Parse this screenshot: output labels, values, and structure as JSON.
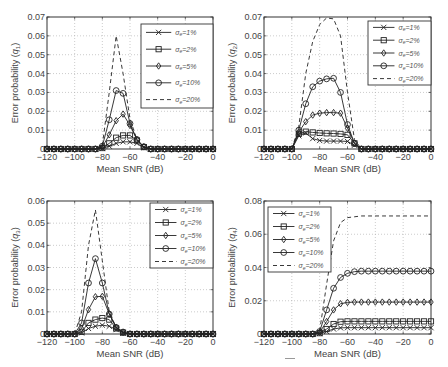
{
  "figure": {
    "x_ticks": [
      -120,
      -100,
      -80,
      -60,
      -40,
      -20,
      0
    ],
    "x_tick_labels": [
      "−120",
      "−100",
      "−80",
      "−60",
      "−40",
      "−20",
      "0"
    ],
    "xlabel": "Mean SNR (dB)",
    "legend_labels": [
      "σe=1%",
      "σe=2%",
      "σe=5%",
      "σe=10%",
      "σe=20%"
    ],
    "legend_prefix": "σ",
    "legend_sub": "e",
    "legend_values": [
      "=1%",
      "=2%",
      "=5%",
      "=10%",
      "=20%"
    ]
  },
  "chart_data": [
    {
      "type": "line",
      "id": "q1",
      "title": "",
      "xlabel": "Mean SNR (dB)",
      "ylabel": "Error probability (q1)",
      "ylabel_main": "Error probability (",
      "ylabel_sym": "q",
      "ylabel_sub": "1",
      "xlim": [
        -120,
        0
      ],
      "ylim": [
        0,
        0.07
      ],
      "y_ticks": [
        0,
        0.01,
        0.02,
        0.03,
        0.04,
        0.05,
        0.06,
        0.07
      ],
      "y_tick_labels": [
        "0",
        "0.01",
        "0.02",
        "0.03",
        "0.04",
        "0.05",
        "0.06",
        "0.07"
      ],
      "grid": true,
      "legend_position": "upper right",
      "x": [
        -120,
        -115,
        -110,
        -105,
        -100,
        -95,
        -90,
        -85,
        -80,
        -75,
        -70,
        -65,
        -60,
        -55,
        -50,
        -45,
        -40,
        -35,
        -30,
        -25,
        -20,
        -15,
        -10,
        -5,
        0
      ],
      "series": [
        {
          "name": "σe=1%",
          "marker": "x",
          "values": [
            0,
            0,
            0,
            0,
            0,
            0,
            0,
            0,
            0.0003,
            0.0015,
            0.003,
            0.0038,
            0.0038,
            0.003,
            0.0008,
            0,
            0,
            0,
            0,
            0,
            0,
            0,
            0,
            0,
            0
          ]
        },
        {
          "name": "σe=2%",
          "marker": "square",
          "values": [
            0,
            0,
            0,
            0,
            0,
            0,
            0,
            0,
            0.0005,
            0.003,
            0.006,
            0.0072,
            0.0072,
            0.0045,
            0.001,
            0,
            0,
            0,
            0,
            0,
            0,
            0,
            0,
            0,
            0
          ]
        },
        {
          "name": "σe=5%",
          "marker": "diamond",
          "values": [
            0,
            0,
            0,
            0,
            0,
            0,
            0,
            0,
            0.001,
            0.0075,
            0.015,
            0.0185,
            0.0125,
            0.005,
            0.0012,
            0,
            0,
            0,
            0,
            0,
            0,
            0,
            0,
            0,
            0
          ]
        },
        {
          "name": "σe=10%",
          "marker": "circle",
          "values": [
            0,
            0,
            0,
            0,
            0,
            0,
            0,
            0,
            0.0015,
            0.0155,
            0.031,
            0.0295,
            0.0135,
            0.005,
            0.0012,
            0,
            0,
            0,
            0,
            0,
            0,
            0,
            0,
            0,
            0
          ]
        },
        {
          "name": "σe=20%",
          "marker": "none",
          "dashed": true,
          "values": [
            0,
            0,
            0,
            0,
            0,
            0,
            0,
            0,
            0.002,
            0.03,
            0.06,
            0.04,
            0.016,
            0.005,
            0.001,
            0,
            0,
            0,
            0,
            0,
            0,
            0,
            0,
            0,
            0
          ]
        }
      ]
    },
    {
      "type": "line",
      "id": "q2",
      "title": "",
      "xlabel": "Mean SNR (dB)",
      "ylabel": "Error probability (q2)",
      "ylabel_main": "Error probability (",
      "ylabel_sym": "q",
      "ylabel_sub": "2",
      "xlim": [
        -120,
        0
      ],
      "ylim": [
        0,
        0.07
      ],
      "y_ticks": [
        0,
        0.01,
        0.02,
        0.03,
        0.04,
        0.05,
        0.06,
        0.07
      ],
      "y_tick_labels": [
        "0",
        "0.01",
        "0.02",
        "0.03",
        "0.04",
        "0.05",
        "0.06",
        "0.07"
      ],
      "grid": true,
      "legend_position": "upper right",
      "x": [
        -120,
        -115,
        -110,
        -105,
        -100,
        -95,
        -90,
        -85,
        -80,
        -75,
        -70,
        -65,
        -60,
        -55,
        -50,
        -45,
        -40,
        -35,
        -30,
        -25,
        -20,
        -15,
        -10,
        -5,
        0
      ],
      "series": [
        {
          "name": "σe=1%",
          "marker": "x",
          "values": [
            0,
            0,
            0,
            0,
            0,
            0.007,
            0.0085,
            0.0055,
            0.0045,
            0.0042,
            0.0042,
            0.0042,
            0.004,
            0.002,
            0,
            0,
            0,
            0,
            0,
            0,
            0,
            0,
            0,
            0,
            0
          ]
        },
        {
          "name": "σe=2%",
          "marker": "square",
          "values": [
            0,
            0,
            0,
            0,
            0,
            0.008,
            0.0092,
            0.0088,
            0.0085,
            0.0083,
            0.0082,
            0.008,
            0.0075,
            0.003,
            0,
            0,
            0,
            0,
            0,
            0,
            0,
            0,
            0,
            0,
            0
          ]
        },
        {
          "name": "σe=5%",
          "marker": "diamond",
          "values": [
            0,
            0,
            0,
            0,
            0,
            0.009,
            0.0145,
            0.018,
            0.019,
            0.0193,
            0.0193,
            0.019,
            0.011,
            0.003,
            0,
            0,
            0,
            0,
            0,
            0,
            0,
            0,
            0,
            0,
            0
          ]
        },
        {
          "name": "σe=10%",
          "marker": "circle",
          "values": [
            0,
            0,
            0,
            0,
            0,
            0.01,
            0.024,
            0.033,
            0.036,
            0.0372,
            0.0375,
            0.03,
            0.013,
            0.003,
            0,
            0,
            0,
            0,
            0,
            0,
            0,
            0,
            0,
            0,
            0
          ]
        },
        {
          "name": "σe=20%",
          "marker": "none",
          "dashed": true,
          "values": [
            0,
            0,
            0,
            0,
            0,
            0.012,
            0.04,
            0.057,
            0.066,
            0.0695,
            0.069,
            0.06,
            0.03,
            0.005,
            0,
            0,
            0,
            0,
            0,
            0,
            0,
            0,
            0,
            0,
            0
          ]
        }
      ]
    },
    {
      "type": "line",
      "id": "q3",
      "title": "",
      "xlabel": "Mean SNR (dB)",
      "ylabel": "Error probability (q3)",
      "ylabel_main": "Error probability (",
      "ylabel_sym": "q",
      "ylabel_sub": "3",
      "xlim": [
        -120,
        0
      ],
      "ylim": [
        0,
        0.06
      ],
      "y_ticks": [
        0,
        0.01,
        0.02,
        0.03,
        0.04,
        0.05,
        0.06
      ],
      "y_tick_labels": [
        "0",
        "0.01",
        "0.02",
        "0.03",
        "0.04",
        "0.05",
        "0.06"
      ],
      "grid": true,
      "legend_position": "upper right",
      "x": [
        -120,
        -115,
        -110,
        -105,
        -100,
        -95,
        -90,
        -85,
        -80,
        -75,
        -70,
        -65,
        -60,
        -55,
        -50,
        -45,
        -40,
        -35,
        -30,
        -25,
        -20,
        -15,
        -10,
        -5,
        0
      ],
      "series": [
        {
          "name": "σe=1%",
          "marker": "x",
          "values": [
            0,
            0,
            0,
            0,
            0,
            0.0005,
            0.0025,
            0.0035,
            0.004,
            0.0035,
            0.002,
            0.0005,
            0,
            0,
            0,
            0,
            0,
            0,
            0,
            0,
            0,
            0,
            0,
            0,
            0
          ]
        },
        {
          "name": "σe=2%",
          "marker": "square",
          "values": [
            0,
            0,
            0,
            0,
            0,
            0.001,
            0.005,
            0.0065,
            0.0072,
            0.0065,
            0.0025,
            0.0006,
            0,
            0,
            0,
            0,
            0,
            0,
            0,
            0,
            0,
            0,
            0,
            0,
            0
          ]
        },
        {
          "name": "σe=5%",
          "marker": "diamond",
          "values": [
            0,
            0,
            0,
            0,
            0,
            0.0025,
            0.011,
            0.0168,
            0.017,
            0.009,
            0.003,
            0.0008,
            0,
            0,
            0,
            0,
            0,
            0,
            0,
            0,
            0,
            0,
            0,
            0,
            0
          ]
        },
        {
          "name": "σe=10%",
          "marker": "circle",
          "values": [
            0,
            0,
            0,
            0,
            0,
            0.005,
            0.023,
            0.034,
            0.023,
            0.009,
            0.003,
            0.0009,
            0,
            0,
            0,
            0,
            0,
            0,
            0,
            0,
            0,
            0,
            0,
            0,
            0
          ]
        },
        {
          "name": "σe=20%",
          "marker": "none",
          "dashed": true,
          "values": [
            0,
            0,
            0,
            0,
            0,
            0.01,
            0.04,
            0.056,
            0.033,
            0.01,
            0.003,
            0.001,
            0,
            0,
            0,
            0,
            0,
            0,
            0,
            0,
            0,
            0,
            0,
            0,
            0
          ]
        }
      ]
    },
    {
      "type": "line",
      "id": "q4",
      "title": "",
      "xlabel": "Mean SNR (dB)",
      "ylabel": "Error probability (q4)",
      "ylabel_main": "Error probability (",
      "ylabel_sym": "q",
      "ylabel_sub": "4",
      "xlim": [
        -120,
        0
      ],
      "ylim": [
        0,
        0.08
      ],
      "y_ticks": [
        0,
        0.02,
        0.04,
        0.06,
        0.08
      ],
      "y_tick_labels": [
        "0",
        "0.02",
        "0.04",
        "0.06",
        "0.08"
      ],
      "grid": true,
      "legend_position": "upper left",
      "x": [
        -120,
        -115,
        -110,
        -105,
        -100,
        -95,
        -90,
        -85,
        -80,
        -75,
        -70,
        -65,
        -60,
        -55,
        -50,
        -45,
        -40,
        -35,
        -30,
        -25,
        -20,
        -15,
        -10,
        -5,
        0
      ],
      "series": [
        {
          "name": "σe=1%",
          "marker": "x",
          "values": [
            0,
            0,
            0,
            0,
            0,
            0,
            0,
            0,
            0.0003,
            0.0015,
            0.003,
            0.0037,
            0.0038,
            0.0038,
            0.0038,
            0.0038,
            0.0038,
            0.0038,
            0.0038,
            0.0038,
            0.0038,
            0.0038,
            0.0038,
            0.0038,
            0.0038
          ]
        },
        {
          "name": "σe=2%",
          "marker": "square",
          "values": [
            0,
            0,
            0,
            0,
            0,
            0,
            0,
            0,
            0.0005,
            0.003,
            0.006,
            0.0074,
            0.0076,
            0.0076,
            0.0076,
            0.0076,
            0.0076,
            0.0076,
            0.0076,
            0.0076,
            0.0076,
            0.0076,
            0.0076,
            0.0076,
            0.0076
          ]
        },
        {
          "name": "σe=5%",
          "marker": "diamond",
          "values": [
            0,
            0,
            0,
            0,
            0,
            0,
            0,
            0,
            0.001,
            0.0075,
            0.0145,
            0.0182,
            0.019,
            0.0192,
            0.0192,
            0.0192,
            0.0192,
            0.0192,
            0.0192,
            0.0192,
            0.0192,
            0.0192,
            0.0192,
            0.0192,
            0.0192
          ]
        },
        {
          "name": "σe=10%",
          "marker": "circle",
          "values": [
            0,
            0,
            0,
            0,
            0,
            0,
            0,
            0,
            0.0015,
            0.0145,
            0.0275,
            0.034,
            0.0365,
            0.0375,
            0.0378,
            0.0378,
            0.0378,
            0.0378,
            0.0378,
            0.0378,
            0.0378,
            0.0378,
            0.0378,
            0.0378,
            0.0378
          ]
        },
        {
          "name": "σe=20%",
          "marker": "none",
          "dashed": true,
          "values": [
            0,
            0,
            0,
            0,
            0,
            0,
            0,
            0,
            0.002,
            0.03,
            0.056,
            0.067,
            0.07,
            0.0705,
            0.071,
            0.071,
            0.071,
            0.071,
            0.071,
            0.071,
            0.071,
            0.071,
            0.071,
            0.071,
            0.071
          ]
        }
      ]
    }
  ],
  "layout": {
    "panels": [
      {
        "left": 47,
        "top": 17,
        "right": 213,
        "bottom": 149,
        "legend": {
          "x": 141,
          "y": 24,
          "w": 72,
          "h": 84
        }
      },
      {
        "left": 264,
        "top": 17,
        "right": 431,
        "bottom": 149,
        "legend": {
          "x": 368,
          "y": 21,
          "w": 63,
          "h": 64
        }
      },
      {
        "left": 47,
        "top": 201,
        "right": 213,
        "bottom": 334,
        "legend": {
          "x": 150,
          "y": 203,
          "w": 63,
          "h": 65
        }
      },
      {
        "left": 264,
        "top": 201,
        "right": 431,
        "bottom": 334,
        "legend": {
          "x": 268,
          "y": 207,
          "w": 63,
          "h": 65
        }
      }
    ]
  }
}
